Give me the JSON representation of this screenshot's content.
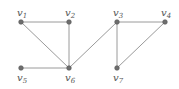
{
  "diagram": {
    "type": "graph",
    "nodes": [
      {
        "id": "v1",
        "label": "v",
        "sub": "1",
        "x": 21,
        "y": 22
      },
      {
        "id": "v2",
        "label": "v",
        "sub": "2",
        "x": 69,
        "y": 22
      },
      {
        "id": "v3",
        "label": "v",
        "sub": "3",
        "x": 117,
        "y": 22
      },
      {
        "id": "v4",
        "label": "v",
        "sub": "4",
        "x": 165,
        "y": 22
      },
      {
        "id": "v5",
        "label": "v",
        "sub": "5",
        "x": 21,
        "y": 68
      },
      {
        "id": "v6",
        "label": "v",
        "sub": "6",
        "x": 69,
        "y": 68
      },
      {
        "id": "v7",
        "label": "v",
        "sub": "7",
        "x": 117,
        "y": 68
      }
    ],
    "edges": [
      [
        "v1",
        "v2"
      ],
      [
        "v1",
        "v6"
      ],
      [
        "v2",
        "v6"
      ],
      [
        "v5",
        "v6"
      ],
      [
        "v6",
        "v3"
      ],
      [
        "v3",
        "v4"
      ],
      [
        "v3",
        "v7"
      ],
      [
        "v7",
        "v4"
      ]
    ],
    "colors": {
      "edge": "#9a9a9a",
      "node": "#6e6e6e",
      "label": "#555555"
    }
  }
}
